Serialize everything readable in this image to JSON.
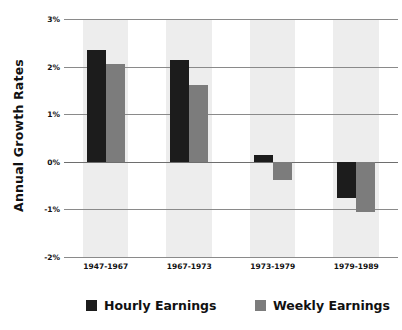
{
  "chart_data": {
    "type": "bar",
    "title": "",
    "subtitle": "",
    "xlabel": "",
    "ylabel": "Annual Growth Rates",
    "categories": [
      "1947-1967",
      "1967-1973",
      "1973-1979",
      "1979-1989"
    ],
    "series": [
      {
        "name": "Hourly Earnings",
        "color": "#1c1c1c",
        "values": [
          2.35,
          2.14,
          0.15,
          -0.76
        ]
      },
      {
        "name": "Weekly Earnings",
        "color": "#7c7c7c",
        "values": [
          2.06,
          1.62,
          -0.38,
          -1.05
        ]
      }
    ],
    "ylim": [
      -2,
      3
    ],
    "yticks": [
      3,
      2,
      1,
      0,
      -1,
      -2
    ],
    "ytick_labels": [
      "3%",
      "2%",
      "1%",
      "0%",
      "-1%",
      "-2%"
    ],
    "ytick_suffix": "%",
    "grid": true,
    "grid_axis": "y",
    "legend_position": "bottom",
    "background_bands": true,
    "band_color": "#ededed",
    "gridline_color": "#8a8a8a",
    "plot_background": "#ffffff"
  },
  "axis": {
    "y_title": "Annual Growth Rates",
    "ticks": [
      {
        "label": "3%",
        "value": 3
      },
      {
        "label": "2%",
        "value": 2
      },
      {
        "label": "1%",
        "value": 1
      },
      {
        "label": "0%",
        "value": 0
      },
      {
        "label": "-1%",
        "value": -1
      },
      {
        "label": "-2%",
        "value": -2
      }
    ]
  },
  "legend": {
    "items": [
      {
        "label": "Hourly Earnings",
        "swatch": "hourly"
      },
      {
        "label": "Weekly Earnings",
        "swatch": "weekly"
      }
    ]
  }
}
